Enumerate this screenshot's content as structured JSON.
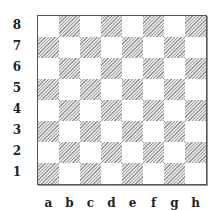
{
  "diagram": {
    "type": "chessboard",
    "ranks": [
      "8",
      "7",
      "6",
      "5",
      "4",
      "3",
      "2",
      "1"
    ],
    "files": [
      "a",
      "b",
      "c",
      "d",
      "e",
      "f",
      "g",
      "h"
    ],
    "colors": {
      "light_square": "#ffffff",
      "dark_square_hatch": "#9a9a9a",
      "border": "#555555",
      "label": "#222222"
    },
    "pieces": []
  }
}
